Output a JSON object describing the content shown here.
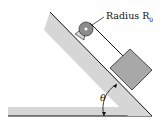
{
  "labels": {
    "radius": "Radius R",
    "radius_sub": "0",
    "angle": "θ"
  },
  "colors": {
    "incline": "#d6d6d6",
    "block": "#a8a8a8",
    "pulley": "#8c8c8c",
    "line": "#111111"
  }
}
